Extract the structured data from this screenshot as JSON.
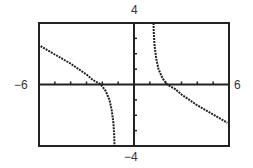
{
  "chart_data": {
    "type": "line",
    "title": "",
    "xlabel": "",
    "ylabel": "",
    "xlim": [
      -6,
      6
    ],
    "ylim": [
      -4,
      4
    ],
    "x_tick_step": 1,
    "y_tick_step": 1,
    "grid": false,
    "legend": null,
    "window_labels": {
      "xmin": "−6",
      "xmax": "6",
      "ymin": "−4",
      "ymax": "4"
    },
    "vertical_asymptotes": [
      -1.2,
      1.2
    ],
    "series": [
      {
        "name": "left-branch",
        "points": [
          [
            -5.9,
            2.5
          ],
          [
            -5.5,
            2.25
          ],
          [
            -5.0,
            1.95
          ],
          [
            -4.5,
            1.65
          ],
          [
            -4.0,
            1.35
          ],
          [
            -3.5,
            1.0
          ],
          [
            -3.0,
            0.65
          ],
          [
            -2.6,
            0.3
          ],
          [
            -2.1,
            0.0
          ],
          [
            -1.8,
            -0.4
          ],
          [
            -1.55,
            -1.0
          ],
          [
            -1.4,
            -1.7
          ],
          [
            -1.3,
            -2.5
          ],
          [
            -1.25,
            -3.3
          ],
          [
            -1.23,
            -4.0
          ]
        ]
      },
      {
        "name": "right-branch",
        "points": [
          [
            1.23,
            4.0
          ],
          [
            1.25,
            3.3
          ],
          [
            1.3,
            2.5
          ],
          [
            1.4,
            1.7
          ],
          [
            1.55,
            1.0
          ],
          [
            1.8,
            0.4
          ],
          [
            2.1,
            0.0
          ],
          [
            2.6,
            -0.3
          ],
          [
            3.0,
            -0.65
          ],
          [
            3.5,
            -1.0
          ],
          [
            4.0,
            -1.35
          ],
          [
            4.5,
            -1.65
          ],
          [
            5.0,
            -1.95
          ],
          [
            5.5,
            -2.25
          ],
          [
            5.9,
            -2.5
          ]
        ]
      }
    ]
  },
  "colors": {
    "frame": "#222222",
    "axes": "#222222",
    "curve": "#222222",
    "label": "#333333",
    "background": "#ffffff"
  }
}
